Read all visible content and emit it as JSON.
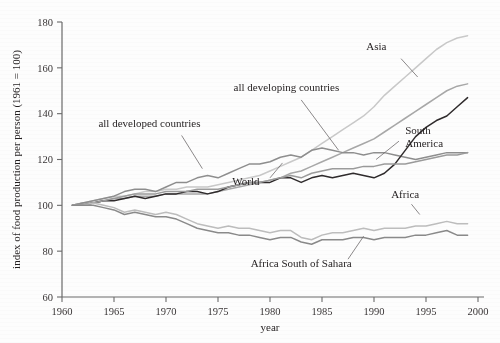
{
  "chart_data": {
    "type": "line",
    "title": "",
    "xlabel": "year",
    "ylabel": "index of food production per person (1961 = 100)",
    "xlim": [
      1960,
      2000
    ],
    "ylim": [
      60,
      180
    ],
    "xticks": [
      1960,
      1965,
      1970,
      1975,
      1980,
      1985,
      1990,
      1995,
      2000
    ],
    "yticks": [
      60,
      80,
      100,
      120,
      140,
      160,
      180
    ],
    "grid": false,
    "legend": "inline-labels",
    "x": [
      1961,
      1962,
      1963,
      1964,
      1965,
      1966,
      1967,
      1968,
      1969,
      1970,
      1971,
      1972,
      1973,
      1974,
      1975,
      1976,
      1977,
      1978,
      1979,
      1980,
      1981,
      1982,
      1983,
      1984,
      1985,
      1986,
      1987,
      1988,
      1989,
      1990,
      1991,
      1992,
      1993,
      1994,
      1995,
      1996,
      1997,
      1998,
      1999
    ],
    "series": [
      {
        "name": "Asia",
        "color": "#c9c9c9",
        "label_x": 1991.2,
        "label_y": 168,
        "leader": [
          [
            1992.6,
            164.0
          ],
          [
            1994.2,
            156.0
          ]
        ],
        "values": [
          100,
          101,
          102,
          103,
          104,
          104,
          105,
          106,
          106,
          107,
          107,
          108,
          108,
          108,
          109,
          110,
          111,
          112,
          113,
          115,
          117,
          119,
          121,
          124,
          127,
          130,
          133,
          136,
          139,
          143,
          148,
          152,
          156,
          160,
          164,
          168,
          171,
          173,
          174
        ]
      },
      {
        "name": "all developing countries",
        "color": "#a8a8a8",
        "label_x": 1976.5,
        "label_y": 150,
        "leader": [
          [
            1983.0,
            146.0
          ],
          [
            1986.6,
            124.0
          ]
        ],
        "values": [
          100,
          101,
          101,
          102,
          103,
          103,
          104,
          104,
          104,
          105,
          105,
          105,
          105,
          105,
          106,
          107,
          108,
          109,
          110,
          111,
          112,
          114,
          115,
          117,
          119,
          121,
          123,
          125,
          127,
          129,
          132,
          135,
          138,
          141,
          144,
          147,
          150,
          152,
          153
        ]
      },
      {
        "name": "all developed countries",
        "color": "#8e8e8e",
        "label_x": 1963.5,
        "label_y": 134,
        "leader": [
          [
            1971.5,
            130.5
          ],
          [
            1973.5,
            116.0
          ]
        ],
        "values": [
          100,
          101,
          102,
          103,
          104,
          106,
          107,
          107,
          106,
          108,
          110,
          110,
          112,
          113,
          112,
          114,
          116,
          118,
          118,
          119,
          121,
          122,
          121,
          124,
          125,
          124,
          123,
          123,
          122,
          123,
          123,
          122,
          121,
          120,
          121,
          122,
          123,
          123,
          123
        ]
      },
      {
        "name": "South America",
        "color": "#2f2b2c",
        "label_x": 1993.0,
        "label_y": 131,
        "leader": [
          [
            1992.4,
            128.0
          ],
          [
            1990.2,
            120.0
          ]
        ],
        "values": [
          100,
          100,
          101,
          102,
          102,
          103,
          104,
          103,
          104,
          105,
          105,
          106,
          106,
          105,
          106,
          108,
          109,
          110,
          110,
          110,
          112,
          112,
          110,
          112,
          113,
          112,
          113,
          114,
          113,
          112,
          114,
          118,
          124,
          130,
          134,
          137,
          139,
          143,
          147
        ]
      },
      {
        "name": "World",
        "color": "#9b9b9b",
        "label_x": 1979.0,
        "label_y": 109,
        "leader": [
          [
            1980.0,
            112.0
          ],
          [
            1981.2,
            118.5
          ]
        ],
        "values": [
          100,
          100,
          101,
          102,
          103,
          104,
          105,
          105,
          105,
          106,
          106,
          106,
          107,
          107,
          107,
          108,
          109,
          110,
          110,
          111,
          112,
          113,
          112,
          114,
          115,
          116,
          116,
          116,
          117,
          117,
          118,
          118,
          118,
          119,
          120,
          121,
          122,
          122,
          123
        ]
      },
      {
        "name": "Africa",
        "color": "#bdbdbd",
        "label_x": 1993.0,
        "label_y": 103,
        "leader": [
          [
            1993.6,
            100.5
          ],
          [
            1994.4,
            96.0
          ]
        ],
        "values": [
          100,
          100,
          101,
          100,
          99,
          97,
          98,
          97,
          96,
          97,
          96,
          94,
          92,
          91,
          90,
          91,
          90,
          90,
          89,
          88,
          89,
          89,
          86,
          85,
          87,
          88,
          88,
          89,
          90,
          89,
          90,
          90,
          90,
          91,
          91,
          92,
          93,
          92,
          92
        ]
      },
      {
        "name": "Africa South of Sahara",
        "color": "#8a8a8a",
        "label_x": 1983.0,
        "label_y": 73,
        "leader": [
          [
            1987.5,
            76.5
          ],
          [
            1989.0,
            86.5
          ]
        ],
        "values": [
          100,
          100,
          100,
          99,
          98,
          96,
          97,
          96,
          95,
          95,
          94,
          92,
          90,
          89,
          88,
          88,
          87,
          87,
          86,
          85,
          86,
          86,
          84,
          83,
          85,
          85,
          85,
          86,
          86,
          85,
          86,
          86,
          86,
          87,
          87,
          88,
          89,
          87,
          87
        ]
      }
    ]
  }
}
